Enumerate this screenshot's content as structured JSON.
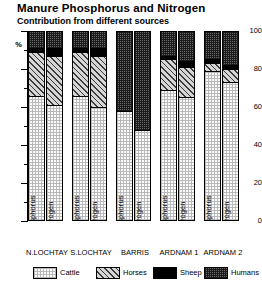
{
  "chart_data": {
    "type": "bar",
    "title": "Manure Phosphorus and Nitrogen",
    "subtitle": "Contribution from different sources",
    "xlabel": "",
    "ylabel": "%",
    "ylim": [
      0,
      100
    ],
    "yticks": [
      0,
      20,
      40,
      60,
      80,
      100
    ],
    "ytick_labels": [
      "0",
      "20",
      "40",
      "60",
      "80",
      "100"
    ],
    "grid": false,
    "legend_position": "bottom",
    "stacked": true,
    "stack_order": [
      "Cattle",
      "Horses",
      "Sheep",
      "Humans"
    ],
    "legend": [
      {
        "name": "Cattle",
        "pattern": "light-grid",
        "color": "#fdfdfd"
      },
      {
        "name": "Horses",
        "pattern": "diagonal-hatch",
        "color": "#d6d6d6"
      },
      {
        "name": "Sheep",
        "pattern": "solid",
        "color": "#000000"
      },
      {
        "name": "Humans",
        "pattern": "dark-stipple",
        "color": "#6a6a6a"
      }
    ],
    "groups": [
      "N.LOCHTAY",
      "S.LOCHTAY",
      "BARRIS",
      "ARDNAM 1",
      "ARDNAM 2"
    ],
    "bars_per_group": [
      "Phosphorus",
      "Nitrogen"
    ],
    "categories": [
      "N.LOCHTAY Phosphorus",
      "N.LOCHTAY Nitrogen",
      "S.LOCHTAY Phosphorus",
      "S.LOCHTAY Nitrogen",
      "BARRIS Phosphorus",
      "BARRIS Nitrogen",
      "ARDNAM 1 Phosphorus",
      "ARDNAM 1 Nitrogen",
      "ARDNAM 2 Phosphorus",
      "ARDNAM 2 Nitrogen"
    ],
    "series": [
      {
        "name": "Cattle",
        "values": [
          65,
          60,
          65,
          59,
          57,
          47,
          68,
          64,
          78,
          72
        ]
      },
      {
        "name": "Horses",
        "values": [
          23,
          26,
          23,
          27,
          0,
          0,
          16,
          16,
          4,
          7
        ]
      },
      {
        "name": "Sheep",
        "values": [
          2,
          4,
          2,
          4,
          0,
          0,
          2,
          3,
          2,
          2
        ]
      },
      {
        "name": "Humans",
        "values": [
          10,
          10,
          10,
          10,
          43,
          53,
          14,
          17,
          16,
          19
        ]
      }
    ]
  },
  "bar_labels": {
    "phosphorus": "Phosphorus",
    "nitrogen": "Nitrogen"
  }
}
